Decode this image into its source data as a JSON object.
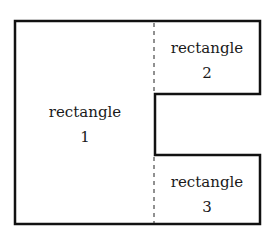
{
  "diagram": {
    "stroke_color": "#111111",
    "shapes": [
      {
        "id": "rectangle-1",
        "label": "rectangle",
        "number": "1"
      },
      {
        "id": "rectangle-2",
        "label": "rectangle",
        "number": "2"
      },
      {
        "id": "rectangle-3",
        "label": "rectangle",
        "number": "3"
      }
    ]
  }
}
